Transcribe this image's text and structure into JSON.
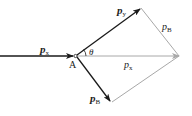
{
  "diagram": {
    "point": {
      "label": "A"
    },
    "angle": {
      "label": "θ"
    },
    "vectors": {
      "incoming": {
        "label_main": "p",
        "label_sub": "x"
      },
      "upper": {
        "label_main": "p",
        "label_sub": "y"
      },
      "lower": {
        "label_main": "p",
        "label_sub": "B"
      },
      "resultant": {
        "label_main": "p",
        "label_sub": "x"
      },
      "parallel_side": {
        "label_main": "p",
        "label_sub": "B"
      }
    },
    "colors": {
      "vector": "#1a1a1a",
      "construction": "#a8a8a8",
      "background": "#ffffff"
    }
  }
}
